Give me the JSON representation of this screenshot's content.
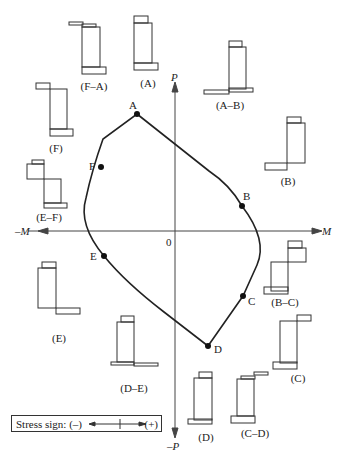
{
  "axes": {
    "positive_x": "M",
    "negative_x": "–M",
    "positive_y": "P",
    "negative_y": "–P",
    "origin": "0"
  },
  "curve_points": [
    {
      "id": "A",
      "label": "A"
    },
    {
      "id": "B",
      "label": "B"
    },
    {
      "id": "C",
      "label": "C"
    },
    {
      "id": "D",
      "label": "D"
    },
    {
      "id": "E",
      "label": "E"
    },
    {
      "id": "F",
      "label": "F"
    }
  ],
  "stress_diagrams": [
    {
      "id": "A",
      "label": "(A)"
    },
    {
      "id": "A-B",
      "label": "(A–B)"
    },
    {
      "id": "B",
      "label": "(B)"
    },
    {
      "id": "B-C",
      "label": "(B–C)"
    },
    {
      "id": "C",
      "label": "(C)"
    },
    {
      "id": "C-D",
      "label": "(C–D)"
    },
    {
      "id": "D",
      "label": "(D)"
    },
    {
      "id": "D-E",
      "label": "(D–E)"
    },
    {
      "id": "E",
      "label": "(E)"
    },
    {
      "id": "E-F",
      "label": "(E–F)"
    },
    {
      "id": "F",
      "label": "(F)"
    },
    {
      "id": "F-A",
      "label": "(F–A)"
    }
  ],
  "legend": {
    "text": "Stress sign: (–)",
    "plus": "(+)"
  },
  "colors": {
    "line": "#222222",
    "axis": "#444444",
    "background": "#ffffff"
  }
}
